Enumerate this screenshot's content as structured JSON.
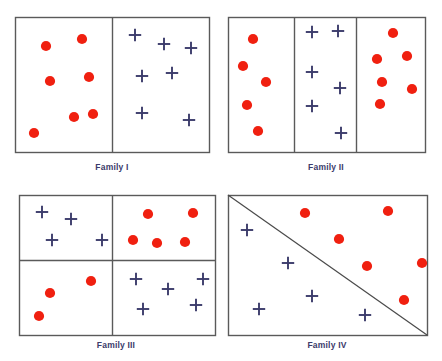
{
  "figure": {
    "title": "",
    "background_color": "#ffffff",
    "dot_color": "#f02010",
    "cross_color": "#3b3b6b",
    "border_color": "#5a5a5a",
    "label_color": "#3b3b6b"
  },
  "panels": [
    {
      "id": "family-1",
      "label": "Family I",
      "label_x": 112,
      "label_y": 162,
      "box": {
        "x": 15,
        "y": 17,
        "w": 194,
        "h": 135
      },
      "dividers": [
        {
          "type": "vertical",
          "x": 112,
          "y1": 17,
          "y2": 152
        }
      ],
      "dots": [
        {
          "x": 46,
          "y": 46
        },
        {
          "x": 82,
          "y": 39
        },
        {
          "x": 50,
          "y": 81
        },
        {
          "x": 89,
          "y": 77
        },
        {
          "x": 74,
          "y": 117
        },
        {
          "x": 93,
          "y": 114
        },
        {
          "x": 34,
          "y": 133
        }
      ],
      "crosses": [
        {
          "x": 135,
          "y": 35
        },
        {
          "x": 164,
          "y": 44
        },
        {
          "x": 191,
          "y": 48
        },
        {
          "x": 142,
          "y": 76
        },
        {
          "x": 172,
          "y": 73
        },
        {
          "x": 142,
          "y": 113
        },
        {
          "x": 189,
          "y": 120
        }
      ]
    },
    {
      "id": "family-2",
      "label": "Family II",
      "label_x": 326,
      "label_y": 162,
      "box": {
        "x": 228,
        "y": 17,
        "w": 197,
        "h": 135
      },
      "dividers": [
        {
          "type": "vertical",
          "x": 294,
          "y1": 17,
          "y2": 152
        },
        {
          "type": "vertical",
          "x": 356,
          "y1": 17,
          "y2": 152
        }
      ],
      "dots": [
        {
          "x": 253,
          "y": 39
        },
        {
          "x": 243,
          "y": 66
        },
        {
          "x": 266,
          "y": 82
        },
        {
          "x": 247,
          "y": 105
        },
        {
          "x": 258,
          "y": 131
        },
        {
          "x": 393,
          "y": 33
        },
        {
          "x": 377,
          "y": 59
        },
        {
          "x": 407,
          "y": 56
        },
        {
          "x": 382,
          "y": 82
        },
        {
          "x": 412,
          "y": 89
        },
        {
          "x": 380,
          "y": 104
        }
      ],
      "crosses": [
        {
          "x": 312,
          "y": 32
        },
        {
          "x": 338,
          "y": 31
        },
        {
          "x": 312,
          "y": 72
        },
        {
          "x": 340,
          "y": 88
        },
        {
          "x": 312,
          "y": 106
        },
        {
          "x": 341,
          "y": 133
        }
      ]
    },
    {
      "id": "family-3",
      "label": "Family III",
      "label_x": 116,
      "label_y": 340,
      "box": {
        "x": 19,
        "y": 195,
        "w": 196,
        "h": 140
      },
      "dividers": [
        {
          "type": "vertical",
          "x": 112,
          "y1": 195,
          "y2": 335
        },
        {
          "type": "horizontal",
          "y": 260,
          "x1": 19,
          "x2": 215
        }
      ],
      "dots": [
        {
          "x": 148,
          "y": 214
        },
        {
          "x": 193,
          "y": 213
        },
        {
          "x": 133,
          "y": 240
        },
        {
          "x": 157,
          "y": 243
        },
        {
          "x": 185,
          "y": 242
        },
        {
          "x": 91,
          "y": 281
        },
        {
          "x": 50,
          "y": 293
        },
        {
          "x": 39,
          "y": 316
        }
      ],
      "crosses": [
        {
          "x": 42,
          "y": 212
        },
        {
          "x": 71,
          "y": 219
        },
        {
          "x": 52,
          "y": 240
        },
        {
          "x": 102,
          "y": 240
        },
        {
          "x": 136,
          "y": 279
        },
        {
          "x": 168,
          "y": 289
        },
        {
          "x": 203,
          "y": 279
        },
        {
          "x": 143,
          "y": 309
        },
        {
          "x": 196,
          "y": 305
        }
      ]
    },
    {
      "id": "family-4",
      "label": "Family IV",
      "label_x": 327,
      "label_y": 340,
      "box": {
        "x": 228,
        "y": 195,
        "w": 199,
        "h": 140
      },
      "dividers": [
        {
          "type": "diagonal",
          "x1": 228,
          "y1": 195,
          "x2": 427,
          "y2": 335
        }
      ],
      "dots": [
        {
          "x": 305,
          "y": 213
        },
        {
          "x": 388,
          "y": 211
        },
        {
          "x": 339,
          "y": 239
        },
        {
          "x": 367,
          "y": 266
        },
        {
          "x": 422,
          "y": 263
        },
        {
          "x": 404,
          "y": 300
        }
      ],
      "crosses": [
        {
          "x": 247,
          "y": 230
        },
        {
          "x": 288,
          "y": 263
        },
        {
          "x": 312,
          "y": 296
        },
        {
          "x": 259,
          "y": 309
        },
        {
          "x": 365,
          "y": 315
        }
      ]
    }
  ]
}
